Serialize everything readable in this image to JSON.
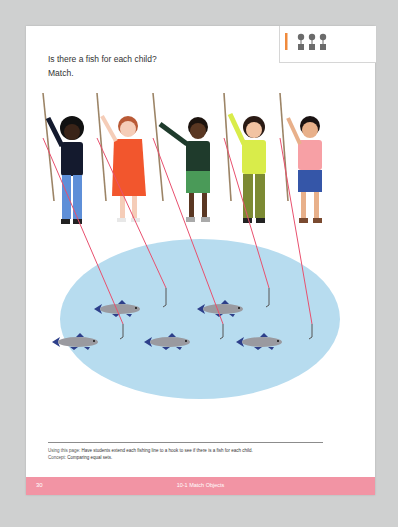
{
  "page": {
    "prompt_line1": "Is there a fish for each child?",
    "prompt_line2": "Match.",
    "icons": {
      "pencil": "pencil-icon",
      "matching": "matching-objects-icon"
    },
    "children": [
      {
        "name": "child-1",
        "shirt": "#141a2e",
        "pants": "#5e8fd8",
        "skin": "#3a2418"
      },
      {
        "name": "child-2",
        "shirt": "#f2562d",
        "pants": "#f2562d",
        "skin": "#f5cdb8"
      },
      {
        "name": "child-3",
        "shirt": "#1f3b2c",
        "pants": "#4a9a58",
        "skin": "#5a3722"
      },
      {
        "name": "child-4",
        "shirt": "#d9ec4a",
        "pants": "#7c8a33",
        "skin": "#f2c3a2"
      },
      {
        "name": "child-5",
        "shirt": "#f7a0a5",
        "pants": "#3556a8",
        "skin": "#e8b08a"
      }
    ],
    "fish_count": 5,
    "colors": {
      "pond": "#b7dcef",
      "fishing_line": "#e8506e",
      "fish_body": "#9a9aa0",
      "fish_fins": "#2d3f8a",
      "footer": "#f294a4"
    }
  },
  "notes": {
    "using_label": "Using this page:",
    "using_text": "Have students extend each fishing line to a hook to see if there is a fish for each child.",
    "concept_label": "Concept:",
    "concept_text": "Comparing equal sets."
  },
  "footer": {
    "page_number": "30",
    "lesson": "10-1 Match Objects"
  }
}
